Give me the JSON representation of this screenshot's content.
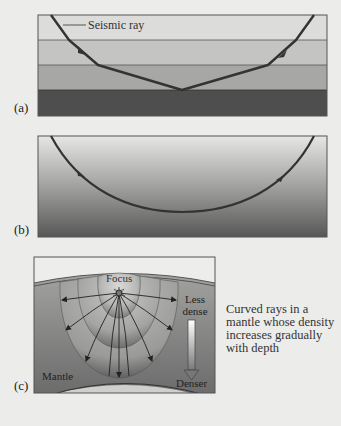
{
  "panels": [
    {
      "id": "a",
      "label": "(a)",
      "description": "Straight-segment seismic ray refracting at boundaries between discrete layers of increasing density",
      "ray_label": "Seismic ray",
      "layer_count": 4,
      "layer_colors": [
        "#dcdcda",
        "#c3c3c1",
        "#a6a6a4",
        "#505050"
      ]
    },
    {
      "id": "b",
      "label": "(b)",
      "description": "Smoothly curved seismic ray in a medium with continuous density gradient",
      "gradient_colors": [
        "#e4e4e2",
        "#5a5a5a"
      ]
    },
    {
      "id": "c",
      "label": "(c)",
      "focus_label": "Focus",
      "less_dense_label": "Less dense",
      "less_dense_lines": [
        "Less",
        "dense"
      ],
      "denser_label": "Denser",
      "mantle_label": "Mantle",
      "wavefront_count": 3,
      "ray_count": 9
    }
  ],
  "caption": "Curved rays in a mantle whose density increases gradually with depth",
  "colors": {
    "background": "#ececea",
    "ray": "#3a3a3a",
    "frame": "#555555"
  }
}
